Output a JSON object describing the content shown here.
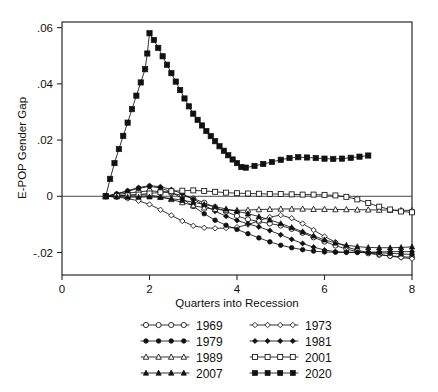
{
  "chart_data": {
    "type": "line",
    "title": "",
    "xlabel": "Quarters into Recession",
    "ylabel": "E-POP Gender Gap",
    "xlim": [
      0,
      8
    ],
    "ylim": [
      -0.028,
      0.062
    ],
    "xticks": [
      0,
      2,
      4,
      6,
      8
    ],
    "xticklabels": [
      "0",
      "2",
      "4",
      "6",
      "8"
    ],
    "yticks": [
      -0.02,
      0,
      0.02,
      0.04,
      0.06
    ],
    "yticklabels": [
      "-.02",
      "0",
      ".02",
      ".04",
      ".06"
    ],
    "grid": false,
    "zero_reference_line": true,
    "legend_position": "below",
    "legend_columns": 2,
    "series": [
      {
        "name": "1969",
        "marker": "circle-open",
        "x": [
          1,
          1.25,
          1.5,
          1.75,
          2,
          2.25,
          2.5,
          2.75,
          3,
          3.25,
          3.5,
          3.75,
          4,
          4.25,
          4.5,
          4.75,
          5,
          5.25,
          5.5,
          5.75,
          6,
          6.25,
          6.5,
          6.75,
          7,
          7.25,
          7.5,
          7.75,
          8
        ],
        "y": [
          0.0,
          0.0006,
          0.0011,
          0.0016,
          0.0019,
          0.0017,
          0.0011,
          0.0003,
          -0.0008,
          -0.0023,
          -0.0039,
          -0.0055,
          -0.007,
          -0.0082,
          -0.009,
          -0.0097,
          -0.0104,
          -0.0116,
          -0.013,
          -0.0146,
          -0.0161,
          -0.0175,
          -0.0188,
          -0.0197,
          -0.0203,
          -0.0208,
          -0.0212,
          -0.0215,
          -0.0217
        ]
      },
      {
        "name": "1973",
        "marker": "diamond-open",
        "x": [
          1,
          1.25,
          1.5,
          1.75,
          2,
          2.25,
          2.5,
          2.75,
          3,
          3.25,
          3.5,
          3.75,
          4,
          4.25,
          4.5,
          4.75,
          5,
          5.25,
          5.5,
          5.75,
          6,
          6.25,
          6.5,
          6.75,
          7,
          7.25,
          7.5,
          7.75,
          8
        ],
        "y": [
          0.0,
          -0.0003,
          -0.0008,
          -0.0016,
          -0.0029,
          -0.0048,
          -0.0068,
          -0.0088,
          -0.0105,
          -0.0112,
          -0.0114,
          -0.0113,
          -0.011,
          -0.0101,
          -0.0087,
          -0.0074,
          -0.0067,
          -0.0078,
          -0.0097,
          -0.012,
          -0.0143,
          -0.0163,
          -0.018,
          -0.0192,
          -0.02,
          -0.0207,
          -0.0213,
          -0.0218,
          -0.0222
        ]
      },
      {
        "name": "1979",
        "marker": "circle-filled",
        "x": [
          1,
          1.25,
          1.5,
          1.75,
          2,
          2.25,
          2.5,
          2.75,
          3,
          3.25,
          3.5,
          3.75,
          4,
          4.25,
          4.5,
          4.75,
          5,
          5.25,
          5.5,
          5.75,
          6,
          6.25,
          6.5,
          6.75,
          7,
          7.25,
          7.5,
          7.75,
          8
        ],
        "y": [
          0.0,
          0.0008,
          0.0018,
          0.0028,
          0.0035,
          0.003,
          0.0015,
          -0.0008,
          -0.0036,
          -0.0062,
          -0.0085,
          -0.0103,
          -0.0118,
          -0.0133,
          -0.0148,
          -0.0162,
          -0.0174,
          -0.0183,
          -0.019,
          -0.0195,
          -0.0198,
          -0.0199,
          -0.0199,
          -0.0199,
          -0.02,
          -0.0201,
          -0.0203,
          -0.0205,
          -0.0207
        ]
      },
      {
        "name": "1981",
        "marker": "diamond-filled",
        "x": [
          1,
          1.25,
          1.5,
          1.75,
          2,
          2.25,
          2.5,
          2.75,
          3,
          3.25,
          3.5,
          3.75,
          4,
          4.25,
          4.5,
          4.75,
          5,
          5.25,
          5.5,
          5.75,
          6,
          6.25,
          6.5,
          6.75,
          7,
          7.25,
          7.5,
          7.75,
          8
        ],
        "y": [
          0.0,
          0.0009,
          0.002,
          0.0031,
          0.0038,
          0.0034,
          0.0024,
          0.0009,
          -0.001,
          -0.0032,
          -0.0053,
          -0.0071,
          -0.0086,
          -0.0098,
          -0.0109,
          -0.0122,
          -0.0137,
          -0.0153,
          -0.0168,
          -0.0181,
          -0.0191,
          -0.0197,
          -0.02,
          -0.02,
          -0.0199,
          -0.0198,
          -0.0197,
          -0.0197,
          -0.0197
        ]
      },
      {
        "name": "1989",
        "marker": "triangle-open",
        "x": [
          1,
          1.25,
          1.5,
          1.75,
          2,
          2.25,
          2.5,
          2.75,
          3,
          3.25,
          3.5,
          3.75,
          4,
          4.25,
          4.5,
          4.75,
          5,
          5.25,
          5.5,
          5.75,
          6,
          6.25,
          6.5,
          6.75,
          7,
          7.25,
          7.5,
          7.75,
          8
        ],
        "y": [
          0.0,
          0.0002,
          0.0004,
          0.0005,
          0.0004,
          -0.0002,
          -0.0011,
          -0.0022,
          -0.0033,
          -0.0041,
          -0.0046,
          -0.0049,
          -0.005,
          -0.0049,
          -0.0047,
          -0.0046,
          -0.0045,
          -0.0045,
          -0.0045,
          -0.0046,
          -0.0046,
          -0.0047,
          -0.0047,
          -0.0048,
          -0.0048,
          -0.0049,
          -0.0049,
          -0.005,
          -0.005
        ]
      },
      {
        "name": "2001",
        "marker": "square-open",
        "x": [
          1,
          1.25,
          1.5,
          1.75,
          2,
          2.25,
          2.5,
          2.75,
          3,
          3.25,
          3.5,
          3.75,
          4,
          4.25,
          4.5,
          4.75,
          5,
          5.25,
          5.5,
          5.75,
          6,
          6.25,
          6.5,
          6.75,
          7,
          7.25,
          7.5,
          7.75,
          8
        ],
        "y": [
          0.0,
          0.0001,
          0.0003,
          0.0006,
          0.001,
          0.0014,
          0.0018,
          0.002,
          0.0021,
          0.0019,
          0.0016,
          0.0013,
          0.0011,
          0.001,
          0.0009,
          0.0008,
          0.0008,
          0.0007,
          0.0006,
          0.0006,
          0.0005,
          0.0003,
          -0.0002,
          -0.0011,
          -0.0024,
          -0.0037,
          -0.0047,
          -0.0054,
          -0.0057
        ]
      },
      {
        "name": "2007",
        "marker": "triangle-filled",
        "x": [
          1,
          1.25,
          1.5,
          1.75,
          2,
          2.25,
          2.5,
          2.75,
          3,
          3.25,
          3.5,
          3.75,
          4,
          4.25,
          4.5,
          4.75,
          5,
          5.25,
          5.5,
          5.75,
          6,
          6.25,
          6.5,
          6.75,
          7,
          7.25,
          7.5,
          7.75,
          8
        ],
        "y": [
          0.0,
          -0.0002,
          -0.0003,
          -0.0003,
          -0.0002,
          -0.0004,
          -0.0008,
          -0.0014,
          -0.0021,
          -0.0029,
          -0.0037,
          -0.0045,
          -0.0053,
          -0.0062,
          -0.0072,
          -0.0084,
          -0.0097,
          -0.0111,
          -0.0126,
          -0.0141,
          -0.0155,
          -0.0166,
          -0.0174,
          -0.0179,
          -0.0182,
          -0.0183,
          -0.0183,
          -0.0182,
          -0.018
        ]
      },
      {
        "name": "2020",
        "marker": "square-filled",
        "x": [
          1,
          1.1,
          1.2,
          1.3,
          1.4,
          1.5,
          1.6,
          1.7,
          1.8,
          1.9,
          1.95,
          2,
          2.1,
          2.2,
          2.3,
          2.4,
          2.5,
          2.6,
          2.7,
          2.8,
          2.9,
          3,
          3.1,
          3.2,
          3.3,
          3.4,
          3.5,
          3.6,
          3.7,
          3.8,
          3.9,
          4,
          4.1,
          4.2,
          4.4,
          4.6,
          4.8,
          5,
          5.2,
          5.4,
          5.6,
          5.8,
          6,
          6.2,
          6.4,
          6.6,
          6.8,
          7
        ],
        "y": [
          0.0,
          0.0062,
          0.0118,
          0.0168,
          0.0215,
          0.0262,
          0.031,
          0.0358,
          0.0405,
          0.0452,
          0.0508,
          0.058,
          0.0556,
          0.0528,
          0.0498,
          0.0468,
          0.0438,
          0.0408,
          0.0378,
          0.0348,
          0.032,
          0.0294,
          0.0272,
          0.0252,
          0.0232,
          0.0214,
          0.0196,
          0.0178,
          0.0162,
          0.0146,
          0.0131,
          0.0118,
          0.0104,
          0.0102,
          0.0108,
          0.0115,
          0.0122,
          0.013,
          0.0136,
          0.0139,
          0.0138,
          0.0136,
          0.0134,
          0.0133,
          0.0134,
          0.0137,
          0.0141,
          0.0145
        ]
      }
    ]
  },
  "legend": {
    "entries": [
      {
        "label": "1969",
        "marker": "circle-open"
      },
      {
        "label": "1973",
        "marker": "diamond-open"
      },
      {
        "label": "1979",
        "marker": "circle-filled"
      },
      {
        "label": "1981",
        "marker": "diamond-filled"
      },
      {
        "label": "1989",
        "marker": "triangle-open"
      },
      {
        "label": "2001",
        "marker": "square-open"
      },
      {
        "label": "2007",
        "marker": "triangle-filled"
      },
      {
        "label": "2020",
        "marker": "square-filled"
      }
    ]
  },
  "colors": {
    "line": "#111111",
    "marker_fill_open": "#ffffff",
    "marker_fill_solid": "#111111",
    "axis": "#262626",
    "background": "#ffffff"
  }
}
